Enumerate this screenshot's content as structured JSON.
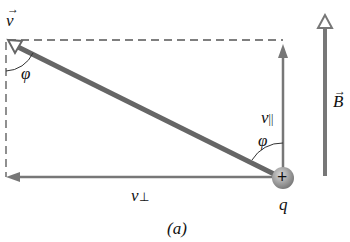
{
  "labels": {
    "velocity": "v",
    "velocity_arrow": "→",
    "phi_top": "φ",
    "phi_bottom": "φ",
    "v_parallel": "v",
    "v_parallel_sub": "||",
    "v_perp": "v",
    "v_perp_sub": "⊥",
    "charge_sign": "+",
    "charge": "q",
    "field": "B",
    "field_arrow": "→",
    "caption": "(a)"
  },
  "colors": {
    "vector": "#707070",
    "dashed": "#555555",
    "text": "#111111"
  }
}
